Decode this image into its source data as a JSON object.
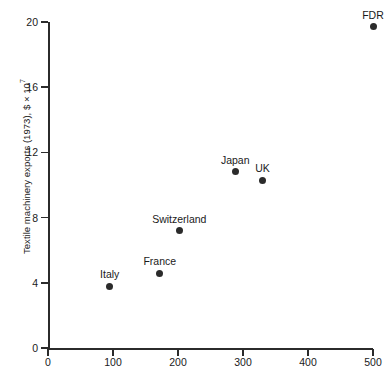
{
  "chart_data": {
    "type": "scatter",
    "title": "",
    "xlabel": "",
    "ylabel": "Textile machinery exports (1973), $ × 10",
    "ylabel_exponent": "7",
    "xlim": [
      0,
      500
    ],
    "ylim": [
      0,
      20
    ],
    "xticks": [
      "0",
      "100",
      "200",
      "300",
      "400",
      "500"
    ],
    "xtick_values": [
      0,
      100,
      200,
      300,
      400,
      500
    ],
    "yticks": [
      "0",
      "4",
      "8",
      "12",
      "16",
      "20"
    ],
    "ytick_values": [
      0,
      4,
      8,
      12,
      16,
      20
    ],
    "grid": false,
    "legend": "none",
    "marker": "filled-circle",
    "marker_color": "#2b2b2b",
    "points": [
      {
        "label": "Italy",
        "x": 95,
        "y": 3.8,
        "label_pos": "above"
      },
      {
        "label": "France",
        "x": 172,
        "y": 4.6,
        "label_pos": "above"
      },
      {
        "label": "Switzerland",
        "x": 202,
        "y": 7.2,
        "label_pos": "above"
      },
      {
        "label": "Japan",
        "x": 288,
        "y": 10.8,
        "label_pos": "above"
      },
      {
        "label": "UK",
        "x": 330,
        "y": 10.3,
        "label_pos": "above"
      },
      {
        "label": "FDR",
        "x": 500,
        "y": 19.7,
        "label_pos": "above"
      }
    ]
  },
  "axes_geometry": {
    "origin_x_px": 48,
    "origin_y_px": 348,
    "x_span_px": 325,
    "y_span_px": 326
  }
}
